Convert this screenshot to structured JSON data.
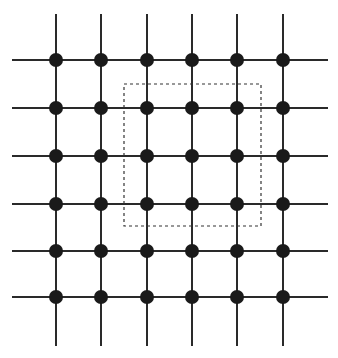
{
  "diagram": {
    "type": "lattice-grid",
    "colors": {
      "background": "#ffffff",
      "line": "#2a2a2a",
      "node": "#1a1a1a",
      "dashed_box": "#333333"
    },
    "grid": {
      "rows": 6,
      "cols": 6,
      "x_positions": [
        56,
        101,
        147,
        192,
        237,
        283
      ],
      "y_positions": [
        60,
        108,
        156,
        204,
        251,
        297
      ],
      "h_line_extent": [
        12,
        328
      ],
      "v_line_extent": [
        14,
        346
      ],
      "line_width": 2,
      "node_radius": 7
    },
    "highlight_box": {
      "style": "dashed",
      "x": 124,
      "y": 84,
      "width": 137,
      "height": 142,
      "enclosed_nodes": "rows 2-4, cols 3-5 (3x3 block)"
    }
  }
}
